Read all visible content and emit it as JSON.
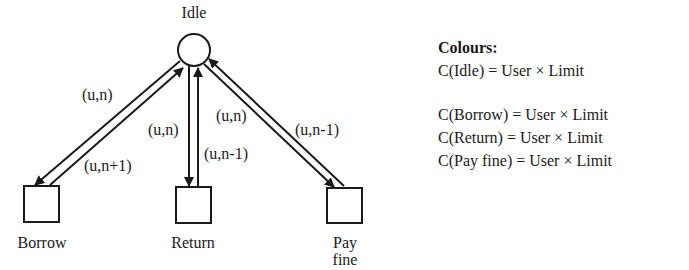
{
  "diagram": {
    "nodes": {
      "idle": {
        "label": "Idle",
        "shape": "circle"
      },
      "borrow": {
        "label": "Borrow",
        "shape": "square"
      },
      "return": {
        "label": "Return",
        "shape": "square"
      },
      "pay_fine": {
        "label_line1": "Pay",
        "label_line2": "fine",
        "shape": "square"
      }
    },
    "arcs": {
      "idle_to_borrow": "(u,n)",
      "borrow_to_idle": "(u,n+1)",
      "idle_to_return": "(u,n)",
      "return_to_idle": "(u,n-1)",
      "idle_to_payfine": "(u,n)",
      "payfine_to_idle": "(u,n-1)"
    },
    "legend": {
      "title": "Colours:",
      "items": [
        "C(Idle) = User × Limit",
        "C(Borrow) = User × Limit",
        "C(Return) = User × Limit",
        "C(Pay fine) = User × Limit"
      ]
    }
  }
}
